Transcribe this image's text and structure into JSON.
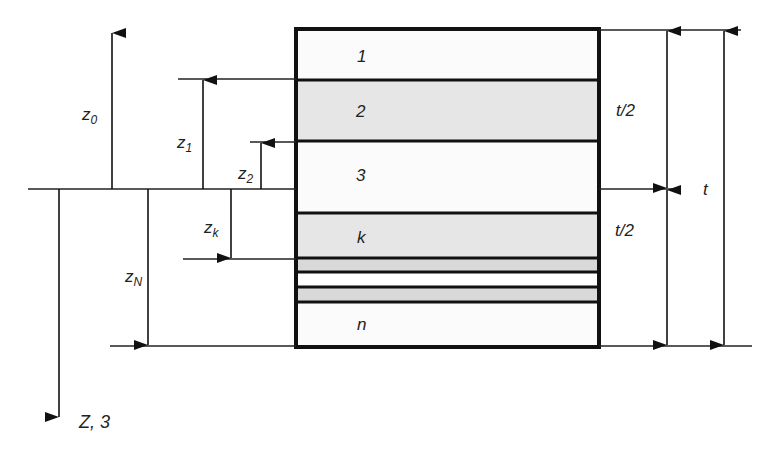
{
  "diagram": {
    "layers": [
      {
        "label": "1",
        "fill": "#fbfbfb"
      },
      {
        "label": "2",
        "fill": "#e6e6e6"
      },
      {
        "label": "3",
        "fill": "#fbfbfb"
      },
      {
        "label": "k",
        "fill": "#e6e6e6"
      },
      {
        "label": "",
        "fill": "#d9d9d9"
      },
      {
        "label": "",
        "fill": "#ffffff"
      },
      {
        "label": "",
        "fill": "#d9d9d9"
      },
      {
        "label": "n",
        "fill": "#fbfbfb"
      }
    ],
    "dimensions": {
      "z0": {
        "base": "z",
        "sub": "0"
      },
      "z1": {
        "base": "z",
        "sub": "1"
      },
      "z2": {
        "base": "z",
        "sub": "2"
      },
      "zk": {
        "base": "z",
        "sub": "k"
      },
      "zN": {
        "base": "z",
        "sub": "N"
      },
      "axis": "Z, 3",
      "half_top": "t/2",
      "half_bottom": "t/2",
      "total": "t"
    }
  }
}
